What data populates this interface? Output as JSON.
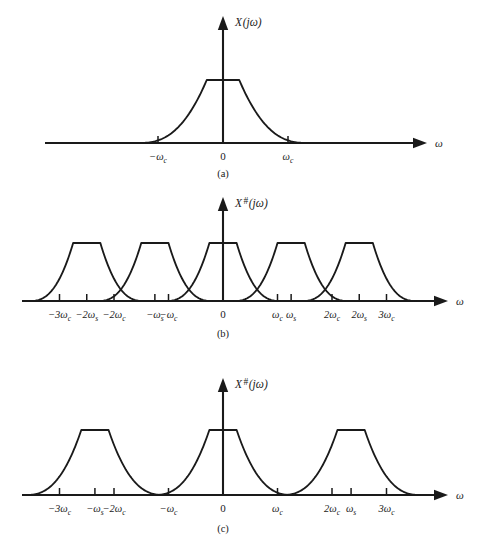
{
  "figure": {
    "background_color": "#ffffff",
    "ink_color": "#1a1a1a"
  },
  "axis_var_label": "ω",
  "zero_label": "0",
  "panels": [
    {
      "id": "a",
      "caption": "(a)",
      "y_axis_label_base": "X",
      "y_axis_label_superscript": "",
      "y_axis_label_arg": "(jω)",
      "ticks": [
        {
          "label_main": "−ω",
          "label_sub": "c",
          "x_units": -1
        },
        {
          "label_main": "0",
          "label_sub": "",
          "x_units": 0
        },
        {
          "label_main": "ω",
          "label_sub": "c",
          "x_units": 1
        }
      ],
      "replicas_centers_units": [
        0
      ]
    },
    {
      "id": "b",
      "caption": "(b)",
      "y_axis_label_base": "X",
      "y_axis_label_superscript": "#",
      "y_axis_label_arg": "(jω)",
      "ticks": [
        {
          "label_main": "−3ω",
          "label_sub": "c",
          "x_units": -3
        },
        {
          "label_main": "−2ω",
          "label_sub": "s",
          "x_units": -2.5
        },
        {
          "label_main": "−2ω",
          "label_sub": "c",
          "x_units": -2
        },
        {
          "label_main": "−ω",
          "label_sub": "s",
          "x_units": -1.25
        },
        {
          "label_main": "−ω",
          "label_sub": "c",
          "x_units": -1
        },
        {
          "label_main": "0",
          "label_sub": "",
          "x_units": 0
        },
        {
          "label_main": "ω",
          "label_sub": "c",
          "x_units": 1
        },
        {
          "label_main": "ω",
          "label_sub": "s",
          "x_units": 1.25
        },
        {
          "label_main": "2ω",
          "label_sub": "c",
          "x_units": 2
        },
        {
          "label_main": "2ω",
          "label_sub": "s",
          "x_units": 2.5
        },
        {
          "label_main": "3ω",
          "label_sub": "c",
          "x_units": 3
        }
      ],
      "replicas_centers_units": [
        -2.5,
        -1.25,
        0,
        1.25,
        2.5
      ]
    },
    {
      "id": "c",
      "caption": "(c)",
      "y_axis_label_base": "X",
      "y_axis_label_superscript": "#",
      "y_axis_label_arg": "(jω)",
      "ticks": [
        {
          "label_main": "−3ω",
          "label_sub": "c",
          "x_units": -3
        },
        {
          "label_main": "−ω",
          "label_sub": "s",
          "x_units": -2.35
        },
        {
          "label_main": "−2ω",
          "label_sub": "c",
          "x_units": -2
        },
        {
          "label_main": "−ω",
          "label_sub": "c",
          "x_units": -1
        },
        {
          "label_main": "0",
          "label_sub": "",
          "x_units": 0
        },
        {
          "label_main": "ω",
          "label_sub": "c",
          "x_units": 1
        },
        {
          "label_main": "2ω",
          "label_sub": "c",
          "x_units": 2
        },
        {
          "label_main": "ω",
          "label_sub": "s",
          "x_units": 2.35
        },
        {
          "label_main": "3ω",
          "label_sub": "c",
          "x_units": 3
        }
      ],
      "replicas_centers_units": [
        -2.35,
        0,
        2.35
      ]
    }
  ],
  "chart_data": {
    "type": "line",
    "xlabel": "ω",
    "ylabel": "X(jω) / X#(jω)",
    "grid": false,
    "legend": "none",
    "panels": [
      {
        "id": "a",
        "caption": "(a)",
        "series_name": "X(jω)",
        "description": "Baseband spectrum: flat plateau between about ±0.25ωc with exponentially decaying skirts reaching the axis near ±ωc.",
        "plateau_half_width_units": 0.25,
        "plateau_height": 1.0,
        "skirt_reaches_zero_at_units": 1.3,
        "replica_centers_units": [
          0
        ],
        "tick_positions_units": [
          -1,
          0,
          1
        ],
        "tick_labels": [
          "−ωc",
          "0",
          "ωc"
        ]
      },
      {
        "id": "b",
        "caption": "(b)",
        "series_name": "X#(jω) with aliasing",
        "description": "Sampled spectrum with ωs = 1.25ωc (undersampled). Five replicas centred at 0, ±ωs, ±2ωs overlap; tails cross above the axis so aliasing occurs.",
        "sampling_rate_units": 1.25,
        "replica_centers_units": [
          -2.5,
          -1.25,
          0,
          1.25,
          2.5
        ],
        "plateau_half_width_units": 0.25,
        "plateau_height": 1.0,
        "aliased": true,
        "tick_positions_units": [
          -3,
          -2.5,
          -2,
          -1.25,
          -1,
          0,
          1,
          1.25,
          2,
          2.5,
          3
        ],
        "tick_labels": [
          "−3ωc",
          "−2ωs",
          "−2ωc",
          "−ωs",
          "−ωc",
          "0",
          "ωc",
          "ωs",
          "2ωc",
          "2ωs",
          "3ωc"
        ]
      },
      {
        "id": "c",
        "caption": "(c)",
        "series_name": "X#(jω) without aliasing",
        "description": "Sampled spectrum with ωs = 2.35ωc (adequately sampled). Three visible replicas centred at 0 and ±ωs are well separated; tails decay to the axis before the next replica begins.",
        "sampling_rate_units": 2.35,
        "replica_centers_units": [
          -2.35,
          0,
          2.35
        ],
        "plateau_half_width_units": 0.25,
        "plateau_height": 1.0,
        "aliased": false,
        "tick_positions_units": [
          -3,
          -2.35,
          -2,
          -1,
          0,
          1,
          2,
          2.35,
          3
        ],
        "tick_labels": [
          "−3ωc",
          "−ωs",
          "−2ωc",
          "−ωc",
          "0",
          "ωc",
          "2ωc",
          "ωs",
          "3ωc"
        ]
      }
    ]
  }
}
